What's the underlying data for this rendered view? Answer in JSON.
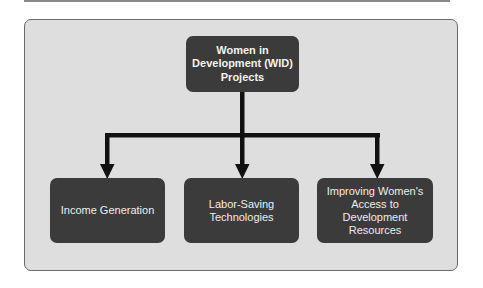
{
  "diagram": {
    "root": {
      "label_lines": [
        "Women in",
        "Development (WID)",
        "Projects"
      ]
    },
    "children": [
      {
        "label_lines": [
          "Income Generation"
        ]
      },
      {
        "label_lines": [
          "Labor-Saving",
          "Technologies"
        ]
      },
      {
        "label_lines": [
          "Improving Women's",
          "Access to",
          "Development",
          "Resources"
        ]
      }
    ],
    "colors": {
      "panel_bg": "#dedede",
      "box_bg": "#3b3b3b",
      "box_text": "#ededed",
      "connector": "#111111"
    }
  }
}
